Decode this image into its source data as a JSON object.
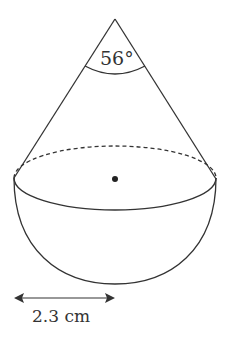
{
  "diagram": {
    "type": "cone-on-hemisphere",
    "angle_label": "56°",
    "radius_label": "2.3 cm",
    "colors": {
      "stroke": "#333333",
      "text": "#333333",
      "background": "#ffffff"
    }
  }
}
